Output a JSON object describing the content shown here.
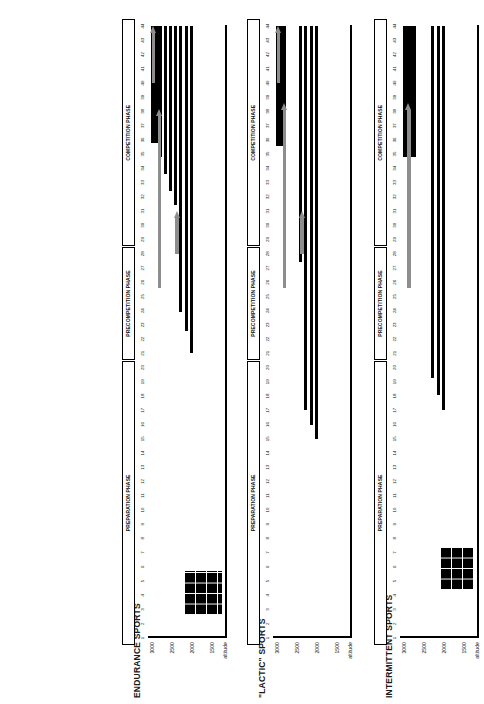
{
  "figure": {
    "kind": "altitude-training-periodization",
    "week_axis_label": "",
    "altitude_axis_label": "altitude",
    "altitude_ticks": [
      "3000",
      "2500",
      "2000",
      "1500"
    ],
    "week_ticks": [
      "1",
      "2",
      "3",
      "4",
      "5",
      "6",
      "7",
      "8",
      "9",
      "10",
      "11",
      "12",
      "13",
      "14",
      "15",
      "16",
      "17",
      "18",
      "19",
      "20",
      "21",
      "22",
      "23",
      "24",
      "25",
      "26",
      "27",
      "28",
      "29",
      "30",
      "31",
      "32",
      "33",
      "34",
      "35",
      "36",
      "37",
      "38",
      "39",
      "40",
      "41",
      "42",
      "43",
      "44"
    ],
    "bar_color": "#000000",
    "arrow_color": "#8d8d8d",
    "axis_color": "#000000"
  },
  "chart_data": [
    {
      "type": "bar",
      "title": "ENDURANCE SPORTS",
      "xlabel": "week",
      "ylabel": "altitude",
      "xlim": [
        1,
        44
      ],
      "ylim": [
        1300,
        3100
      ],
      "yticks": [
        3000,
        2500,
        2000,
        1500
      ],
      "grid": false,
      "legend": "none",
      "phases": [
        {
          "label": "PREPARATION PHASE",
          "from": 1,
          "to": 20
        },
        {
          "label": "PRECOMPETITION PHASE",
          "from": 21,
          "to": 28
        },
        {
          "label": "COMPETITION PHASE",
          "from": 29,
          "to": 44
        }
      ],
      "camps": [
        {
          "kind": "hypoxic-grid",
          "from_week": 2.6,
          "to_week": 5.7,
          "altitude_low": 1300,
          "altitude_high": 2250
        },
        {
          "kind": "bar",
          "from_week": 21.0,
          "to_week": 44.0,
          "altitude": 2060
        },
        {
          "kind": "bar",
          "from_week": 22.6,
          "to_week": 44.0,
          "altitude": 2200
        },
        {
          "kind": "bar",
          "from_week": 23.9,
          "to_week": 44.0,
          "altitude": 2330
        },
        {
          "kind": "bar",
          "from_week": 31.4,
          "to_week": 44.0,
          "altitude": 2460
        },
        {
          "kind": "bar",
          "from_week": 32.4,
          "to_week": 44.0,
          "altitude": 2600
        },
        {
          "kind": "bar",
          "from_week": 33.6,
          "to_week": 44.0,
          "altitude": 2720
        },
        {
          "kind": "bar",
          "from_week": 34.8,
          "to_week": 44.0,
          "altitude": 2840
        },
        {
          "kind": "block",
          "from_week": 35.8,
          "to_week": 44.0,
          "altitude_low": 2880,
          "altitude_high": 3080
        },
        {
          "kind": "bar",
          "from_week": 39.4,
          "to_week": 44.0,
          "altitude": 2330
        },
        {
          "kind": "bar",
          "from_week": 40.3,
          "to_week": 44.0,
          "altitude": 2460
        },
        {
          "kind": "bar",
          "from_week": 41.3,
          "to_week": 44.0,
          "altitude": 2600
        },
        {
          "kind": "bar",
          "from_week": 42.3,
          "to_week": 44.0,
          "altitude": 2720
        },
        {
          "kind": "bar",
          "from_week": 43.2,
          "to_week": 44.0,
          "altitude": 2840
        }
      ],
      "arrows": [
        {
          "from_week": 28.0,
          "to_week": 31.0,
          "altitude": 2420
        },
        {
          "from_week": 25.6,
          "to_week": 38.2,
          "altitude": 2860
        },
        {
          "from_week": 40.0,
          "to_week": 44.0,
          "altitude": 3010
        }
      ]
    },
    {
      "type": "bar",
      "title": "\"LACTIC\" SPORTS",
      "xlabel": "week",
      "ylabel": "altitude",
      "xlim": [
        1,
        44
      ],
      "ylim": [
        1300,
        3100
      ],
      "yticks": [
        3000,
        2500,
        2000,
        1500
      ],
      "grid": false,
      "legend": "none",
      "phases": [
        {
          "label": "PREPARATION PHASE",
          "from": 1,
          "to": 20
        },
        {
          "label": "PRECOMPETITION PHASE",
          "from": 21,
          "to": 28
        },
        {
          "label": "COMPETITION PHASE",
          "from": 29,
          "to": 44
        }
      ],
      "camps": [
        {
          "kind": "bar",
          "from_week": 15.0,
          "to_week": 44.0,
          "altitude": 2060
        },
        {
          "kind": "bar",
          "from_week": 16.0,
          "to_week": 44.0,
          "altitude": 2200
        },
        {
          "kind": "bar",
          "from_week": 17.0,
          "to_week": 44.0,
          "altitude": 2330
        },
        {
          "kind": "bar",
          "from_week": 21.0,
          "to_week": 44.0,
          "altitude": 2060
        },
        {
          "kind": "bar",
          "from_week": 22.1,
          "to_week": 44.0,
          "altitude": 2200
        },
        {
          "kind": "bar",
          "from_week": 23.1,
          "to_week": 44.0,
          "altitude": 2330
        },
        {
          "kind": "bar",
          "from_week": 25.2,
          "to_week": 44.0,
          "altitude": 2200
        },
        {
          "kind": "bar",
          "from_week": 26.4,
          "to_week": 44.0,
          "altitude": 2330
        },
        {
          "kind": "bar",
          "from_week": 27.4,
          "to_week": 44.0,
          "altitude": 2460
        },
        {
          "kind": "block",
          "from_week": 35.6,
          "to_week": 44.0,
          "altitude_low": 2820,
          "altitude_high": 3080
        },
        {
          "kind": "bar",
          "from_week": 36.5,
          "to_week": 44.0,
          "altitude": 2940
        }
      ],
      "arrows": [
        {
          "from_week": 28.0,
          "to_week": 31.0,
          "altitude": 2420
        },
        {
          "from_week": 25.6,
          "to_week": 38.6,
          "altitude": 2860
        },
        {
          "from_week": 40.0,
          "to_week": 44.0,
          "altitude": 3010
        }
      ]
    },
    {
      "type": "bar",
      "title": "INTERMITTENT SPORTS",
      "xlabel": "week",
      "ylabel": "altitude",
      "xlim": [
        1,
        44
      ],
      "ylim": [
        1300,
        3100
      ],
      "yticks": [
        3000,
        2500,
        2000,
        1500
      ],
      "grid": false,
      "legend": "none",
      "phases": [
        {
          "label": "PREPARATION PHASE",
          "from": 1,
          "to": 20
        },
        {
          "label": "PRECOMPETITION PHASE",
          "from": 21,
          "to": 28
        },
        {
          "label": "COMPETITION PHASE",
          "from": 29,
          "to": 44
        }
      ],
      "camps": [
        {
          "kind": "hypoxic-grid",
          "from_week": 4.4,
          "to_week": 7.4,
          "altitude_low": 1300,
          "altitude_high": 2150
        },
        {
          "kind": "bar",
          "from_week": 17.0,
          "to_week": 44.0,
          "altitude": 2060
        },
        {
          "kind": "bar",
          "from_week": 18.1,
          "to_week": 44.0,
          "altitude": 2200
        },
        {
          "kind": "bar",
          "from_week": 19.3,
          "to_week": 44.0,
          "altitude": 2330
        },
        {
          "kind": "bar",
          "from_week": 25.1,
          "to_week": 44.0,
          "altitude": 2060
        },
        {
          "kind": "bar",
          "from_week": 26.3,
          "to_week": 44.0,
          "altitude": 2200
        },
        {
          "kind": "bar",
          "from_week": 27.6,
          "to_week": 44.0,
          "altitude": 2330
        },
        {
          "kind": "block",
          "from_week": 34.8,
          "to_week": 44.0,
          "altitude_low": 2760,
          "altitude_high": 3080
        },
        {
          "kind": "bar",
          "from_week": 36.5,
          "to_week": 44.0,
          "altitude": 2940
        }
      ],
      "arrows": [
        {
          "from_week": 25.6,
          "to_week": 38.6,
          "altitude": 2930
        }
      ]
    }
  ]
}
